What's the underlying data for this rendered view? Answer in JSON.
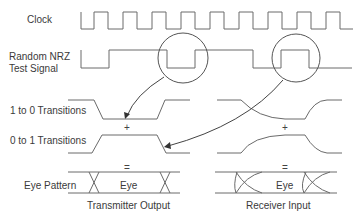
{
  "labels": {
    "clock": "Clock",
    "nrz_line1": "Random NRZ",
    "nrz_line2": "Test Signal",
    "one_to_zero": "1 to 0 Transitions",
    "zero_to_one": "0 to 1 Transitions",
    "eye_pattern": "Eye Pattern",
    "eye_left": "Eye",
    "eye_right": "Eye",
    "transmitter_output": "Transmitter Output",
    "receiver_input": "Receiver Input"
  },
  "symbols": {
    "plus_left": "+",
    "plus_right": "+",
    "equals_left": "=",
    "equals_right": "="
  },
  "colors": {
    "stroke": "#6a6a6a",
    "text": "#3a3a3a",
    "background": "#ffffff"
  }
}
